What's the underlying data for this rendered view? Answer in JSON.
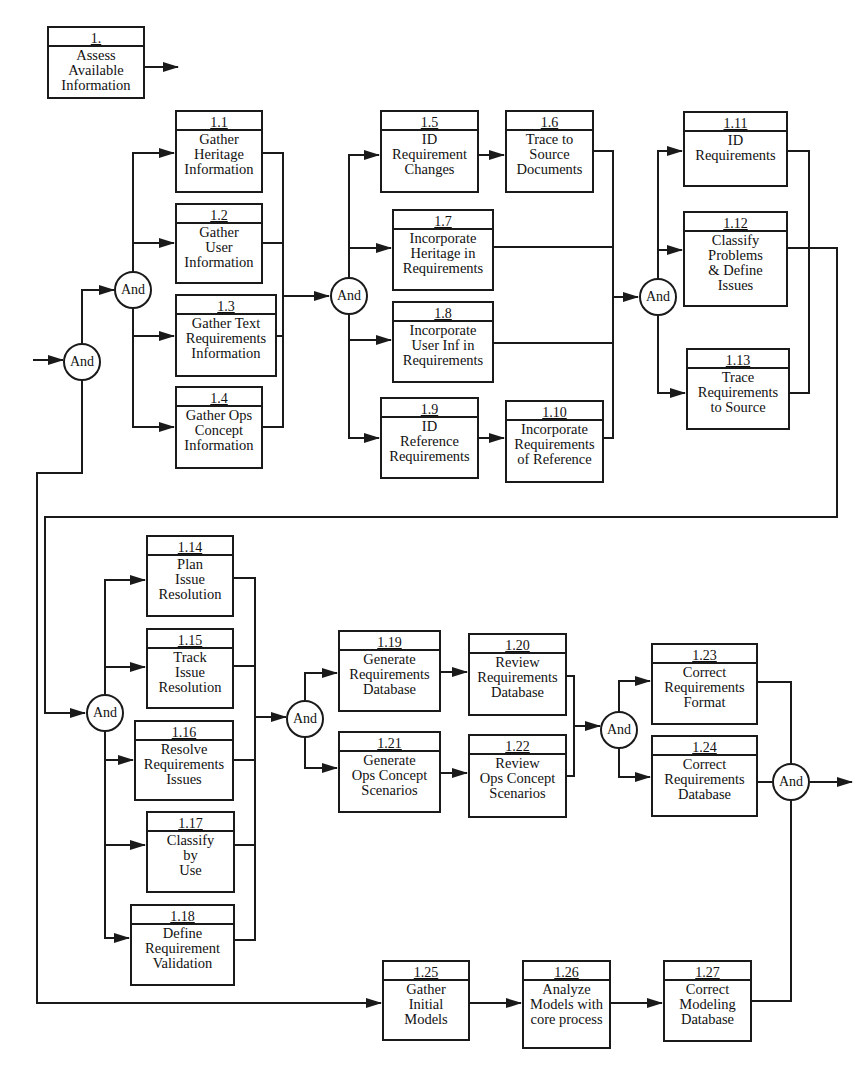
{
  "diagram": {
    "type": "functional-flow-block-diagram",
    "gate_label": "And",
    "colors": {
      "line": "#1a1a1a",
      "background": "#ffffff"
    },
    "top_box": {
      "id": "1",
      "number": "1.",
      "label": "Assess\nAvailable\nInformation",
      "x": 47,
      "y": 26,
      "w": 98,
      "h": 73
    },
    "boxes": [
      {
        "id": "1.1",
        "number": "1.1",
        "label": "Gather\nHeritage\nInformation",
        "x": 175,
        "y": 110,
        "w": 88,
        "h": 83
      },
      {
        "id": "1.2",
        "number": "1.2",
        "label": "Gather\nUser\nInformation",
        "x": 175,
        "y": 203,
        "w": 88,
        "h": 81
      },
      {
        "id": "1.3",
        "number": "1.3",
        "label": "Gather Text\nRequirements\nInformation",
        "x": 175,
        "y": 294,
        "w": 102,
        "h": 83
      },
      {
        "id": "1.4",
        "number": "1.4",
        "label": "Gather Ops\nConcept\nInformation",
        "x": 175,
        "y": 386,
        "w": 88,
        "h": 83
      },
      {
        "id": "1.5",
        "number": "1.5",
        "label": "ID\nRequirement\nChanges",
        "x": 380,
        "y": 110,
        "w": 99,
        "h": 83
      },
      {
        "id": "1.6",
        "number": "1.6",
        "label": "Trace to\nSource\nDocuments",
        "x": 505,
        "y": 110,
        "w": 89,
        "h": 83
      },
      {
        "id": "1.7",
        "number": "1.7",
        "label": "Incorporate\nHeritage in\nRequirements",
        "x": 392,
        "y": 209,
        "w": 102,
        "h": 82
      },
      {
        "id": "1.8",
        "number": "1.8",
        "label": "Incorporate\nUser Inf in\nRequirements",
        "x": 392,
        "y": 301,
        "w": 102,
        "h": 82
      },
      {
        "id": "1.9",
        "number": "1.9",
        "label": "ID\nReference\nRequirements",
        "x": 380,
        "y": 397,
        "w": 99,
        "h": 82
      },
      {
        "id": "1.10",
        "number": "1.10",
        "label": "Incorporate\nRequirements\nof Reference",
        "x": 505,
        "y": 400,
        "w": 99,
        "h": 83
      },
      {
        "id": "1.11",
        "number": "1.11",
        "label": "ID\nRequirements",
        "x": 683,
        "y": 111,
        "w": 105,
        "h": 76
      },
      {
        "id": "1.12",
        "number": "1.12",
        "label": "Classify\nProblems\n& Define\nIssues",
        "x": 683,
        "y": 211,
        "w": 105,
        "h": 96
      },
      {
        "id": "1.13",
        "number": "1.13",
        "label": "Trace\nRequirements\nto Source",
        "x": 686,
        "y": 348,
        "w": 104,
        "h": 82
      },
      {
        "id": "1.14",
        "number": "1.14",
        "label": "Plan\nIssue\nResolution",
        "x": 146,
        "y": 535,
        "w": 88,
        "h": 82
      },
      {
        "id": "1.15",
        "number": "1.15",
        "label": "Track\nIssue\nResolution",
        "x": 146,
        "y": 628,
        "w": 88,
        "h": 81
      },
      {
        "id": "1.16",
        "number": "1.16",
        "label": "Resolve\nRequirements\nIssues",
        "x": 134,
        "y": 720,
        "w": 100,
        "h": 81
      },
      {
        "id": "1.17",
        "number": "1.17",
        "label": "Classify\nby\nUse",
        "x": 146,
        "y": 811,
        "w": 89,
        "h": 82
      },
      {
        "id": "1.18",
        "number": "1.18",
        "label": "Define\nRequirement\nValidation",
        "x": 130,
        "y": 904,
        "w": 105,
        "h": 82
      },
      {
        "id": "1.19",
        "number": "1.19",
        "label": "Generate\nRequirements\nDatabase",
        "x": 338,
        "y": 630,
        "w": 103,
        "h": 82
      },
      {
        "id": "1.20",
        "number": "1.20",
        "label": "Review\nRequirements\nDatabase",
        "x": 468,
        "y": 633,
        "w": 99,
        "h": 83
      },
      {
        "id": "1.21",
        "number": "1.21",
        "label": "Generate\nOps Concept\nScenarios",
        "x": 338,
        "y": 731,
        "w": 103,
        "h": 82
      },
      {
        "id": "1.22",
        "number": "1.22",
        "label": "Review\nOps Concept\nScenarios",
        "x": 468,
        "y": 734,
        "w": 99,
        "h": 84
      },
      {
        "id": "1.23",
        "number": "1.23",
        "label": "Correct\nRequirements\nFormat",
        "x": 651,
        "y": 643,
        "w": 107,
        "h": 82
      },
      {
        "id": "1.24",
        "number": "1.24",
        "label": "Correct\nRequirements\nDatabase",
        "x": 651,
        "y": 735,
        "w": 107,
        "h": 82
      },
      {
        "id": "1.25",
        "number": "1.25",
        "label": "Gather\nInitial\nModels",
        "x": 382,
        "y": 960,
        "w": 88,
        "h": 81
      },
      {
        "id": "1.26",
        "number": "1.26",
        "label": "Analyze\nModels with\ncore process",
        "x": 522,
        "y": 960,
        "w": 89,
        "h": 89
      },
      {
        "id": "1.27",
        "number": "1.27",
        "label": "Correct\nModeling\nDatabase",
        "x": 663,
        "y": 960,
        "w": 89,
        "h": 82
      }
    ],
    "gates": [
      {
        "id": "gate-a",
        "label": "And",
        "cx": 82,
        "cy": 362
      },
      {
        "id": "gate-b",
        "label": "And",
        "cx": 133,
        "cy": 290
      },
      {
        "id": "gate-c",
        "label": "And",
        "cx": 349,
        "cy": 296
      },
      {
        "id": "gate-d",
        "label": "And",
        "cx": 658,
        "cy": 297
      },
      {
        "id": "gate-e",
        "label": "And",
        "cx": 105,
        "cy": 713
      },
      {
        "id": "gate-f",
        "label": "And",
        "cx": 305,
        "cy": 719
      },
      {
        "id": "gate-g",
        "label": "And",
        "cx": 619,
        "cy": 730
      },
      {
        "id": "gate-h",
        "label": "And",
        "cx": 791,
        "cy": 782
      }
    ]
  }
}
